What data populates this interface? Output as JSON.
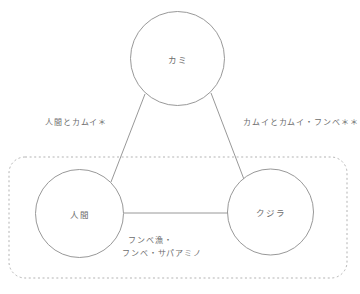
{
  "diagram": {
    "type": "relationship-triad-diagram",
    "nodes": [
      {
        "id": "kamui",
        "label": "カミ",
        "cx": 177.5,
        "cy": 58.5,
        "r": 47
      },
      {
        "id": "ningen",
        "label": "人間",
        "cx": 79.5,
        "cy": 213.5,
        "r": 44
      },
      {
        "id": "kujira",
        "label": "クジラ",
        "cx": 270.5,
        "cy": 212.0,
        "r": 43
      }
    ],
    "edges": [
      {
        "id": "ningen-kamui",
        "from": "ningen",
        "to": "kamui",
        "label": "人間とカムイ＊"
      },
      {
        "id": "kamui-fumbe",
        "from": "kamui",
        "to": "kujira",
        "label": "カムイとカムイ・フンベ＊＊"
      },
      {
        "id": "ningen-kujira",
        "from": "ningen",
        "to": "kujira",
        "label_line1": "フンベ漁・",
        "label_line2": "フンベ・サパアミノ"
      }
    ],
    "grouping_box": {
      "id": "earthly-realm-box",
      "style": "dotted-rounded-rectangle",
      "x": 9,
      "y": 157,
      "width": 338,
      "height": 121
    },
    "colors": {
      "stroke": "#8c8c8c",
      "text": "#6d6d6d",
      "dotted": "#b0b0b0",
      "background": "#ffffff"
    }
  }
}
